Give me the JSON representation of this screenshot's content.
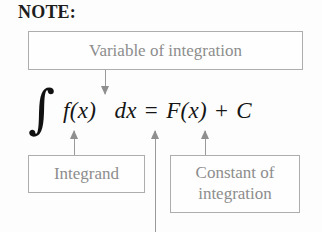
{
  "heading": {
    "label": "NOTE:"
  },
  "callouts": {
    "variable": {
      "label": "Variable of integration"
    },
    "integrand": {
      "label": "Integrand"
    },
    "constant": {
      "line1": "Constant of",
      "line2": "integration"
    }
  },
  "formula": {
    "integral_symbol": "∫",
    "integrand": "f(x)",
    "differential": "dx",
    "equals": "=",
    "antiderivative": "F(x)",
    "plus": "+",
    "constant": "C",
    "full_text": "∫ f(x) dx = F(x) + C"
  },
  "annotations": {
    "arrow_variable_to_dx": "arrow-down",
    "arrow_integrand_to_fx": "arrow-up",
    "arrow_dx_pointer": "arrow-up",
    "arrow_constant_to_c": "arrow-up"
  },
  "colors": {
    "box_border": "#adadad",
    "box_text": "#8d8d8d",
    "formula_text": "#151515",
    "arrow": "#9a9a9a",
    "heading_text": "#1d1d1d",
    "background": "#fdfdfd"
  }
}
